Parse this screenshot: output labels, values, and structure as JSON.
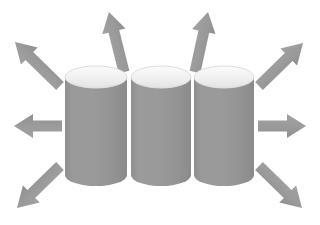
{
  "canvas": {
    "width": 320,
    "height": 225,
    "background": "#ffffff",
    "title": "Three cylinders with eight radiating arrows"
  },
  "palette": {
    "cylinder_body": "#949494",
    "cylinder_body_light": "#a8a8a8",
    "cylinder_body_dark": "#8a8a8a",
    "cylinder_top_fill": "#f1f1f1",
    "cylinder_top_edge": "#d8d8d8",
    "arrow": "#9a9a9a",
    "arrow_shade": "#8f8f8f",
    "background": "#ffffff"
  },
  "cylinders": [
    {
      "name": "cylinder-left",
      "label": "Cylinder 1",
      "x": 65,
      "y": 66,
      "width": 62,
      "height": 120,
      "ellipse_ry": 11
    },
    {
      "name": "cylinder-center",
      "label": "Cylinder 2",
      "x": 131,
      "y": 66,
      "width": 60,
      "height": 120,
      "ellipse_ry": 11
    },
    {
      "name": "cylinder-right",
      "label": "Cylinder 3",
      "x": 194,
      "y": 66,
      "width": 60,
      "height": 120,
      "ellipse_ry": 11
    }
  ],
  "arrows": [
    {
      "name": "arrow-up-left-diagonal",
      "label": "Up-left diagonal arrow",
      "direction": "up-left",
      "angle_deg": 225,
      "tail_x": 60,
      "tail_y": 86,
      "tip_x": 15,
      "tip_y": 42,
      "thickness": 11,
      "head_width": 24,
      "head_length": 20
    },
    {
      "name": "arrow-up-slight-left",
      "label": "Upward arrow tilted left",
      "direction": "up",
      "angle_deg": 285,
      "tail_x": 124,
      "tail_y": 72,
      "tip_x": 109,
      "tip_y": 12,
      "thickness": 11,
      "head_width": 24,
      "head_length": 20
    },
    {
      "name": "arrow-up-slight-right",
      "label": "Upward arrow tilted right",
      "direction": "up",
      "angle_deg": 285,
      "tail_x": 195,
      "tail_y": 72,
      "tip_x": 208,
      "tip_y": 12,
      "thickness": 11,
      "head_width": 24,
      "head_length": 20
    },
    {
      "name": "arrow-up-right-diagonal",
      "label": "Up-right diagonal arrow",
      "direction": "up-right",
      "angle_deg": 315,
      "tail_x": 259,
      "tail_y": 86,
      "tip_x": 303,
      "tip_y": 43,
      "thickness": 11,
      "head_width": 24,
      "head_length": 20
    },
    {
      "name": "arrow-left",
      "label": "Left arrow",
      "direction": "left",
      "angle_deg": 180,
      "tail_x": 62,
      "tail_y": 126,
      "tip_x": 14,
      "tip_y": 126,
      "thickness": 11,
      "head_width": 24,
      "head_length": 19
    },
    {
      "name": "arrow-right",
      "label": "Right arrow",
      "direction": "right",
      "angle_deg": 0,
      "tail_x": 258,
      "tail_y": 126,
      "tip_x": 306,
      "tip_y": 126,
      "thickness": 11,
      "head_width": 24,
      "head_length": 19
    },
    {
      "name": "arrow-down-left-diagonal",
      "label": "Down-left diagonal arrow",
      "direction": "down-left",
      "angle_deg": 135,
      "tail_x": 60,
      "tail_y": 166,
      "tip_x": 17,
      "tip_y": 208,
      "thickness": 11,
      "head_width": 24,
      "head_length": 20
    },
    {
      "name": "arrow-down-right-diagonal",
      "label": "Down-right diagonal arrow",
      "direction": "down-right",
      "angle_deg": 45,
      "tail_x": 259,
      "tail_y": 166,
      "tip_x": 302,
      "tip_y": 208,
      "thickness": 11,
      "head_width": 24,
      "head_length": 20
    }
  ],
  "counts": {
    "cylinders": 3,
    "arrows": 8
  }
}
